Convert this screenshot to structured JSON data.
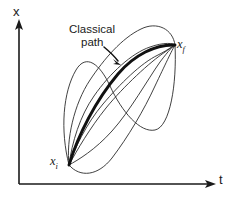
{
  "figure": {
    "kind": "path-integral-diagram",
    "background_color": "#ffffff",
    "ink_color": "#1a1a1a",
    "axes": {
      "vertical": {
        "name": "x-axis",
        "label": "x",
        "origin": [
          19,
          184
        ],
        "tip": [
          19,
          22
        ]
      },
      "horizontal": {
        "name": "t-axis",
        "label": "t",
        "origin": [
          19,
          184
        ],
        "tip": [
          215,
          184
        ]
      }
    },
    "annotation": {
      "line_1": "Classical",
      "line_2": "path",
      "pointer_from": [
        106,
        49
      ],
      "pointer_to": [
        120,
        64
      ]
    },
    "endpoints": {
      "initial": {
        "label_main": "x",
        "label_sub": "i",
        "position": [
          69,
          165
        ]
      },
      "final": {
        "label_main": "x",
        "label_sub": "f",
        "position": [
          175,
          45
        ]
      }
    },
    "paths": {
      "classical": {
        "name": "classical-path",
        "stroke_width": 2.9,
        "color": "#111111",
        "d": "M 69 165 C 78 135 96 100 118 74 C 134 55 156 44 175 45"
      },
      "quantum": [
        {
          "name": "quantum-path-1",
          "d": "M 69 165 C 60 130 63 92 76 70 C 86 53 100 64 110 86 C 122 112 140 133 155 130 C 170 127 177 84 175 45"
        },
        {
          "name": "quantum-path-2",
          "d": "M 69 165 C 66 140 74 104 90 80 C 104 59 122 38 141 29 C 157 21 173 29 175 45"
        },
        {
          "name": "quantum-path-3",
          "d": "M 69 165 C 74 150 86 124 103 104 C 120 84 141 63 158 55 C 170 49 175 44 175 45"
        },
        {
          "name": "quantum-path-4",
          "d": "M 69 165 C 80 178 98 176 112 158 C 128 137 144 110 155 86 C 165 65 172 50 175 45"
        },
        {
          "name": "quantum-path-5",
          "d": "M 69 165 C 78 160 95 150 112 131 C 130 111 148 79 160 62 C 169 50 174 45 175 45"
        },
        {
          "name": "quantum-path-6",
          "d": "M 69 165 C 72 142 80 116 94 96 C 110 73 132 53 150 47 C 164 42 174 43 175 45"
        },
        {
          "name": "quantum-path-7",
          "d": "M 69 165 C 77 150 90 128 106 108 C 124 86 150 62 165 52 C 172 47 175 45 175 45"
        }
      ]
    }
  }
}
